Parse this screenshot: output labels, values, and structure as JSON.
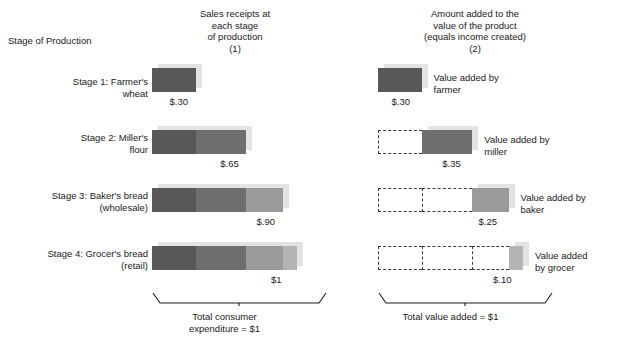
{
  "headers": {
    "stage_of_production": "Stage of Production",
    "col1": "Sales receipts at\neach stage\nof production",
    "col1_line1": "Sales receipts at",
    "col1_line2": "each stage",
    "col1_line3": "of production",
    "col1_number": "(1)",
    "col2_line1": "Amount added to the",
    "col2_line2": "value of the product",
    "col2_line3": "(equals income created)",
    "col2_number": "(2)"
  },
  "rows": [
    {
      "label_line1": "Stage 1: Farmer's",
      "label_line2": "wheat",
      "receipts_value": "$.30",
      "receipts_total": 0.3,
      "added_value": "$.35",
      "added_label_line1": "Value added by",
      "added_label_line2": "farmer",
      "added_amount": 0.3,
      "added_value_label": "$.30",
      "prior_segments": [],
      "receipt_segments": [
        {
          "name": "farmer",
          "amount": 0.3,
          "color": "#585858"
        }
      ]
    },
    {
      "label_line1": "Stage 2: Miller's",
      "label_line2": "flour",
      "receipts_value": "$.65",
      "receipts_total": 0.65,
      "added_label_line1": "Value added by",
      "added_label_line2": "miller",
      "added_amount": 0.35,
      "added_value_label": "$.35",
      "prior_segments": [
        0.3
      ],
      "receipt_segments": [
        {
          "name": "farmer",
          "amount": 0.3,
          "color": "#585858"
        },
        {
          "name": "miller",
          "amount": 0.35,
          "color": "#6e6e6e"
        }
      ]
    },
    {
      "label_line1": "Stage 3: Baker's bread",
      "label_line2": "(wholesale)",
      "receipts_value": "$.90",
      "receipts_total": 0.9,
      "added_label_line1": "Value added by",
      "added_label_line2": "baker",
      "added_amount": 0.25,
      "added_value_label": "$.25",
      "prior_segments": [
        0.3,
        0.35
      ],
      "receipt_segments": [
        {
          "name": "farmer",
          "amount": 0.3,
          "color": "#585858"
        },
        {
          "name": "miller",
          "amount": 0.35,
          "color": "#6e6e6e"
        },
        {
          "name": "baker",
          "amount": 0.25,
          "color": "#9a9a9a"
        }
      ]
    },
    {
      "label_line1": "Stage 4: Grocer's bread",
      "label_line2": "(retail)",
      "receipts_value": "$1",
      "receipts_total": 1.0,
      "added_label_line1": "Value added",
      "added_label_line2": "by grocer",
      "added_amount": 0.1,
      "added_value_label": "$.10",
      "prior_segments": [
        0.3,
        0.35,
        0.25
      ],
      "receipt_segments": [
        {
          "name": "farmer",
          "amount": 0.3,
          "color": "#585858"
        },
        {
          "name": "miller",
          "amount": 0.35,
          "color": "#6e6e6e"
        },
        {
          "name": "baker",
          "amount": 0.25,
          "color": "#9a9a9a"
        },
        {
          "name": "grocer",
          "amount": 0.1,
          "color": "#b4b4b4"
        }
      ]
    }
  ],
  "totals": {
    "left_line1": "Total consumer",
    "left_line2": "expenditure  =  $1",
    "right_line1": "Total value added  =  $1"
  },
  "chart_data": {
    "type": "bar",
    "categories": [
      "Stage 1: Farmer's wheat",
      "Stage 2: Miller's flour",
      "Stage 3: Baker's bread (wholesale)",
      "Stage 4: Grocer's bread (retail)"
    ],
    "series": [
      {
        "name": "Sales receipts at each stage of production (1)",
        "values": [
          0.3,
          0.65,
          0.9,
          1.0
        ]
      },
      {
        "name": "Amount added to the value of the product (2)",
        "values": [
          0.3,
          0.35,
          0.25,
          0.1
        ]
      }
    ],
    "value_added_by": [
      "farmer",
      "miller",
      "baker",
      "grocer"
    ],
    "total_consumer_expenditure": 1.0,
    "total_value_added": 1.0,
    "xlabel": "Dollars",
    "ylabel": "Stage of Production",
    "xlim": [
      0,
      1.0
    ],
    "grid": false,
    "legend": "right-of-bars",
    "units": "US dollars"
  }
}
